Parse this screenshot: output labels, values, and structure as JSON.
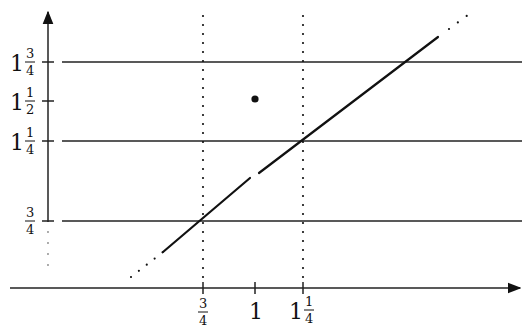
{
  "diagram": {
    "colors": {
      "ink": "#111111",
      "background": "#ffffff"
    },
    "x_axis": {
      "ticks": [
        {
          "value": 0.75,
          "whole": "",
          "num": "3",
          "den": "4"
        },
        {
          "value": 1.0,
          "whole": "1",
          "num": "",
          "den": ""
        },
        {
          "value": 1.25,
          "whole": "1",
          "num": "1",
          "den": "4"
        }
      ]
    },
    "y_axis": {
      "ticks": [
        {
          "value": 1.75,
          "whole": "1",
          "num": "3",
          "den": "4"
        },
        {
          "value": 1.5,
          "whole": "1",
          "num": "1",
          "den": "2"
        },
        {
          "value": 1.25,
          "whole": "1",
          "num": "1",
          "den": "4"
        },
        {
          "value": 0.75,
          "whole": "",
          "num": "3",
          "den": "4"
        }
      ],
      "dotted_below": 0.75
    },
    "horizontal_lines": [
      1.75,
      1.25,
      0.75
    ],
    "dotted_vertical_lines": [
      0.75,
      1.25
    ],
    "diagonal_line": {
      "equation": "y = x",
      "gap_at": 1.0,
      "dotted_ends": true
    },
    "isolated_point": {
      "x": 1.0,
      "y": 1.5
    }
  }
}
